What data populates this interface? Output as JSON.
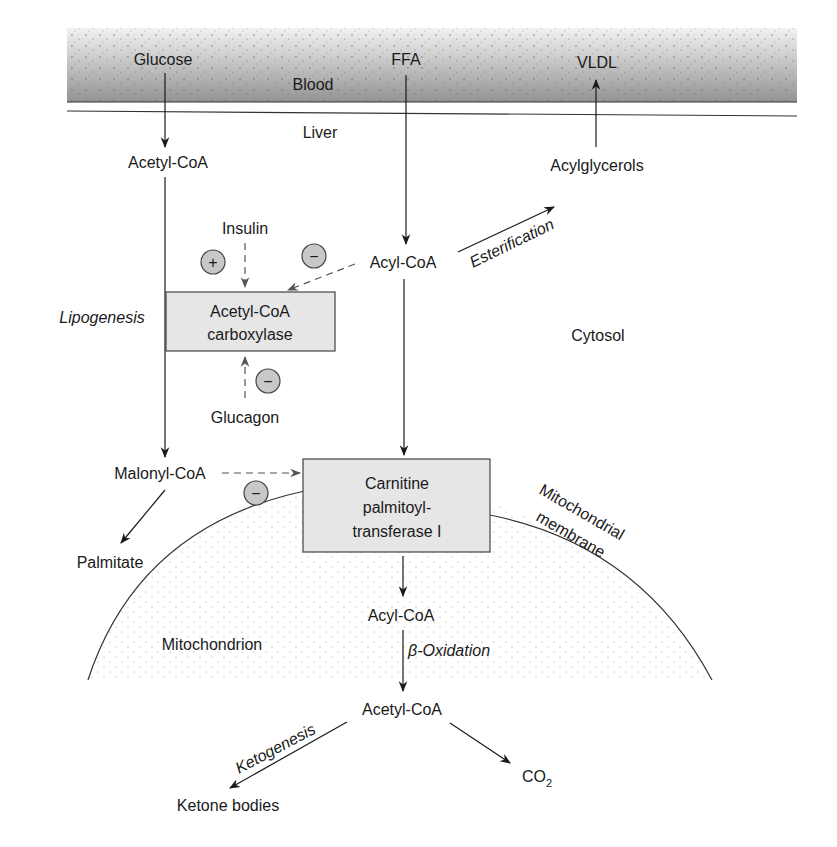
{
  "diagram": {
    "compartments": {
      "blood": "Blood",
      "liver": "Liver",
      "cytosol": "Cytosol",
      "mitochondrion": "Mitochondrion",
      "membrane_line1": "Mitochondrial",
      "membrane_line2": "membrane"
    },
    "metabolites": {
      "glucose": "Glucose",
      "ffa": "FFA",
      "vldl": "VLDL",
      "acetyl_coa_cytosol": "Acetyl-CoA",
      "acylglycerols": "Acylglycerols",
      "acyl_coa_cytosol": "Acyl-CoA",
      "malonyl_coa": "Malonyl-CoA",
      "palmitate": "Palmitate",
      "acyl_coa_mito": "Acyl-CoA",
      "acetyl_coa_mito": "Acetyl-CoA",
      "ketone_bodies": "Ketone bodies",
      "co2": "CO",
      "co2_subscript": "2"
    },
    "hormones": {
      "insulin": "Insulin",
      "glucagon": "Glucagon"
    },
    "enzymes": {
      "acc_line1": "Acetyl-CoA",
      "acc_line2": "carboxylase",
      "cpt_line1": "Carnitine",
      "cpt_line2": "palmitoyl-",
      "cpt_line3": "transferase I"
    },
    "processes": {
      "lipogenesis": "Lipogenesis",
      "esterification": "Esterification",
      "beta_oxidation_symbol": "β",
      "beta_oxidation": "-Oxidation",
      "ketogenesis": "Ketogenesis"
    },
    "regulation_signs": {
      "insulin_effect": "+",
      "acyl_coa_effect": "−",
      "glucagon_effect": "−",
      "malonyl_coa_effect": "−"
    },
    "colors": {
      "blood_band_light": "#e8e8e8",
      "blood_band_dark": "#9a9a9a",
      "enzyme_box_fill": "#e6e6e6",
      "sign_circle_fill": "#c8c8c8",
      "line": "#2a2a2a",
      "dashed_line": "#555555"
    }
  }
}
